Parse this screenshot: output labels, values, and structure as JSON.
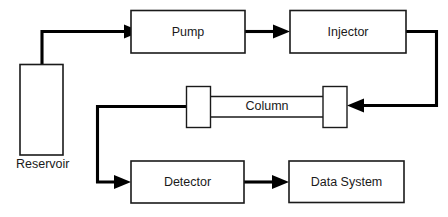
{
  "diagram": {
    "type": "flowchart",
    "background_color": "#ffffff",
    "line_color": "#000000",
    "box_stroke_color": "#1a1a1a",
    "nodes": [
      {
        "id": "reservoir",
        "label": "Reservoir",
        "label_position": "below",
        "shape": "tall-rectangle"
      },
      {
        "id": "pump",
        "label": "Pump",
        "label_position": "inside",
        "shape": "rectangle"
      },
      {
        "id": "injector",
        "label": "Injector",
        "label_position": "inside",
        "shape": "rectangle"
      },
      {
        "id": "column",
        "label": "Column",
        "label_position": "inside",
        "shape": "column-tube"
      },
      {
        "id": "detector",
        "label": "Detector",
        "label_position": "inside",
        "shape": "rectangle"
      },
      {
        "id": "data-system",
        "label": "Data System",
        "label_position": "inside",
        "shape": "rectangle"
      }
    ],
    "connections": [
      {
        "from": "reservoir",
        "to": "pump",
        "arrow": true
      },
      {
        "from": "pump",
        "to": "injector",
        "arrow": true
      },
      {
        "from": "injector",
        "to": "column",
        "arrow": true
      },
      {
        "from": "column",
        "to": "detector",
        "arrow": true
      },
      {
        "from": "detector",
        "to": "data-system",
        "arrow": true
      }
    ]
  }
}
